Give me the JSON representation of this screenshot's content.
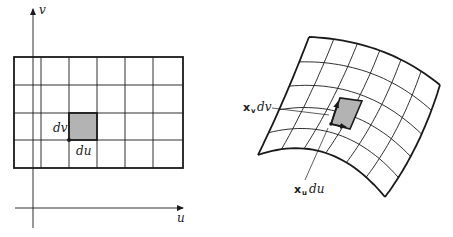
{
  "figure": {
    "left_panel": {
      "name": "parameter-domain",
      "axes": {
        "horizontal_label": "u",
        "vertical_label": "v"
      },
      "grid": {
        "columns": 6,
        "rows": 4
      },
      "highlighted_cell": {
        "column": 3,
        "row": 3
      },
      "labels": {
        "dv": "dv",
        "du": "du"
      }
    },
    "right_panel": {
      "name": "mapped-surface-patch",
      "grid": {
        "columns": 6,
        "rows": 5
      },
      "labels": {
        "xv_vector": "x",
        "xv_subscript": "v",
        "xv_differential": "dv",
        "xu_vector": "x",
        "xu_subscript": "u",
        "xu_differential": "du"
      }
    },
    "colors": {
      "line": "#1a1a1a",
      "shade": "#b3b3b3",
      "background": "#ffffff"
    }
  }
}
